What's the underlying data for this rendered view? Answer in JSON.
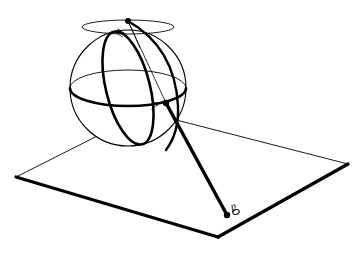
{
  "figure": {
    "background_color": "#ffffff",
    "ink_color": "#000000",
    "width": 362,
    "height": 253,
    "caption_fragment": ""
  },
  "labels": {
    "north_pole": "N",
    "sphere_point": "P",
    "plane_point": "p"
  },
  "geometry": {
    "sphere": {
      "center_x": 128,
      "center_y": 88,
      "radius": 58,
      "outline_stroke": 1.1,
      "equator_front_stroke": 2.6,
      "equator_back_stroke": 0.9,
      "equator_ry": 18,
      "meridian_stroke": 2.6,
      "meridian_rx": 22,
      "polar_cap_ry": 7,
      "polar_cap_rx": 46,
      "polar_cap_stroke": 0.9
    },
    "plane": {
      "left_corner": [
        16,
        177
      ],
      "top_corner": [
        145,
        112
      ],
      "right_corner": [
        348,
        164
      ],
      "bottom_corner": [
        218,
        237
      ],
      "near_edge_stroke": 3.2,
      "far_edge_stroke": 0.9
    },
    "north_pole_point": [
      128,
      21
    ],
    "sphere_point_P": [
      166,
      103
    ],
    "plane_point_p": [
      227,
      215
    ],
    "ray_stroke": 3.4,
    "guide_stroke": 0.8,
    "point_dot_radius": 2.6
  },
  "elements": {
    "sphere_name": "sphere-outline",
    "equator_name": "equator-ellipse",
    "meridian_name": "meridian-ellipse",
    "polar_cap_name": "polar-circle",
    "plane_name": "projection-plane",
    "ray_name": "projection-ray",
    "guide_name": "guide-line-N-to-P"
  }
}
